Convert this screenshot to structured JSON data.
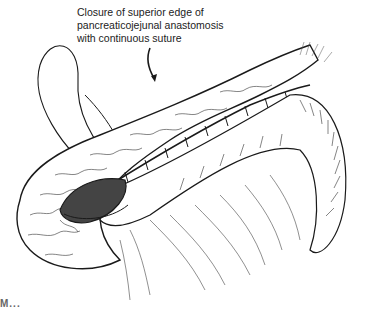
{
  "figure": {
    "type": "surgical illustration",
    "subject": "pancreaticojejunal anastomosis",
    "annotation": {
      "lines": [
        "Closure of superior edge of",
        "pancreaticojejunal anastomosis",
        "with continuous suture"
      ],
      "pointer": "curved arrow pointing to superior suture line"
    },
    "elements": [
      "pancreas remnant (lobulated texture)",
      "jejunal loop",
      "continuous suture line",
      "suture needle loop",
      "mesentery vessels"
    ],
    "label_partial": "M..."
  },
  "colors": {
    "ink": "#1a1a1a",
    "background": "#ffffff"
  }
}
